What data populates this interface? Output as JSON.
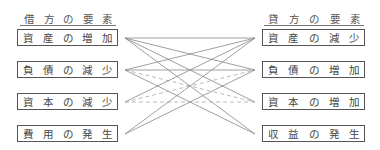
{
  "diagram": {
    "left_header": [
      "借",
      "方",
      "の",
      "要",
      "素"
    ],
    "right_header": [
      "貸",
      "方",
      "の",
      "要",
      "素"
    ],
    "left_items": [
      {
        "chars": [
          "資",
          "産",
          "の",
          "増",
          "加"
        ]
      },
      {
        "chars": [
          "負",
          "債",
          "の",
          "減",
          "少"
        ]
      },
      {
        "chars": [
          "資",
          "本",
          "の",
          "減",
          "少"
        ]
      },
      {
        "chars": [
          "費",
          "用",
          "の",
          "発",
          "生"
        ]
      }
    ],
    "right_items": [
      {
        "chars": [
          "資",
          "産",
          "の",
          "減",
          "少"
        ]
      },
      {
        "chars": [
          "負",
          "債",
          "の",
          "増",
          "加"
        ]
      },
      {
        "chars": [
          "資",
          "本",
          "の",
          "増",
          "加"
        ]
      },
      {
        "chars": [
          "収",
          "益",
          "の",
          "発",
          "生"
        ]
      }
    ],
    "connections": [
      {
        "from": 0,
        "to": 0,
        "style": "solid"
      },
      {
        "from": 0,
        "to": 1,
        "style": "solid"
      },
      {
        "from": 0,
        "to": 2,
        "style": "solid"
      },
      {
        "from": 0,
        "to": 3,
        "style": "solid"
      },
      {
        "from": 1,
        "to": 0,
        "style": "solid"
      },
      {
        "from": 1,
        "to": 1,
        "style": "solid"
      },
      {
        "from": 1,
        "to": 2,
        "style": "dashed"
      },
      {
        "from": 1,
        "to": 3,
        "style": "solid"
      },
      {
        "from": 2,
        "to": 0,
        "style": "solid"
      },
      {
        "from": 2,
        "to": 1,
        "style": "dashed"
      },
      {
        "from": 2,
        "to": 2,
        "style": "dashed"
      },
      {
        "from": 3,
        "to": 0,
        "style": "solid"
      },
      {
        "from": 3,
        "to": 1,
        "style": "solid"
      }
    ],
    "colors": {
      "line": "#888888",
      "dashed_line": "#aaaaaa",
      "box_border": "#555555",
      "text": "#444444"
    }
  }
}
